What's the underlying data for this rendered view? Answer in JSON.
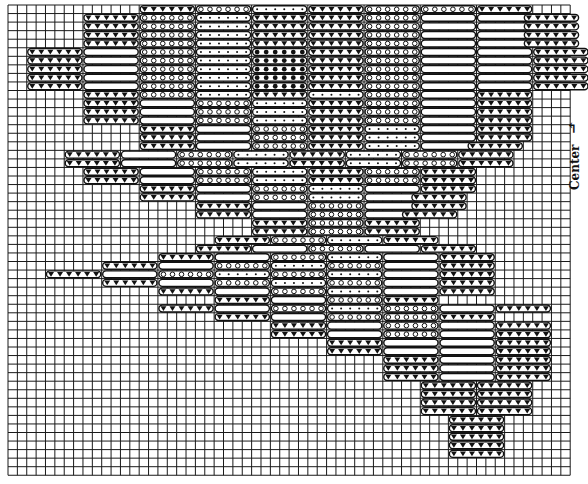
{
  "label": {
    "center": "Center",
    "arrow": "↰"
  },
  "colors": {
    "grid": "#1a1a1a",
    "ink": "#111111",
    "paper": "#ffffff"
  },
  "grid": {
    "x0": 8,
    "y0": 5,
    "cols": 60,
    "rows": 55,
    "cw": 9.37,
    "ch": 8.55
  },
  "pill_len": 6,
  "legend": {
    "tri": "triangle stitch (dark)",
    "empty": "blank stitch",
    "circ": "circle stitch",
    "dot": "dot stitch",
    "solid": "solid dot stitch"
  },
  "rows": [
    {
      "r": 0,
      "pills": [
        [
          14,
          "tri"
        ],
        [
          20,
          "circ"
        ],
        [
          26,
          "dot"
        ],
        [
          32,
          "tri"
        ],
        [
          38,
          "circ"
        ],
        [
          44,
          "circ"
        ],
        [
          50,
          "tri"
        ]
      ]
    },
    {
      "r": 1,
      "pills": [
        [
          8,
          "tri"
        ],
        [
          14,
          "circ"
        ],
        [
          20,
          "dot"
        ],
        [
          26,
          "tri"
        ],
        [
          32,
          "tri"
        ],
        [
          38,
          "circ"
        ],
        [
          44,
          "empty"
        ],
        [
          50,
          "empty"
        ],
        [
          55,
          "tri"
        ]
      ]
    },
    {
      "r": 2,
      "pills": [
        [
          8,
          "tri"
        ],
        [
          14,
          "circ"
        ],
        [
          20,
          "dot"
        ],
        [
          26,
          "tri"
        ],
        [
          32,
          "tri"
        ],
        [
          38,
          "circ"
        ],
        [
          44,
          "empty"
        ],
        [
          50,
          "empty"
        ],
        [
          55,
          "tri"
        ]
      ]
    },
    {
      "r": 3,
      "pills": [
        [
          8,
          "tri"
        ],
        [
          14,
          "circ"
        ],
        [
          20,
          "dot"
        ],
        [
          26,
          "tri"
        ],
        [
          32,
          "tri"
        ],
        [
          38,
          "circ"
        ],
        [
          44,
          "empty"
        ],
        [
          50,
          "empty"
        ],
        [
          55,
          "tri"
        ]
      ]
    },
    {
      "r": 4,
      "pills": [
        [
          8,
          "tri"
        ],
        [
          14,
          "circ"
        ],
        [
          20,
          "dot"
        ],
        [
          26,
          "tri"
        ],
        [
          32,
          "tri"
        ],
        [
          38,
          "circ"
        ],
        [
          44,
          "empty"
        ],
        [
          50,
          "empty"
        ],
        [
          55,
          "tri"
        ]
      ]
    },
    {
      "r": 5,
      "pills": [
        [
          2,
          "tri"
        ],
        [
          8,
          "empty"
        ],
        [
          14,
          "circ"
        ],
        [
          20,
          "dot"
        ],
        [
          26,
          "solid"
        ],
        [
          32,
          "tri"
        ],
        [
          38,
          "circ"
        ],
        [
          44,
          "empty"
        ],
        [
          50,
          "empty"
        ],
        [
          56,
          "tri"
        ]
      ]
    },
    {
      "r": 6,
      "pills": [
        [
          2,
          "tri"
        ],
        [
          8,
          "empty"
        ],
        [
          14,
          "circ"
        ],
        [
          20,
          "dot"
        ],
        [
          26,
          "solid"
        ],
        [
          32,
          "tri"
        ],
        [
          38,
          "circ"
        ],
        [
          44,
          "empty"
        ],
        [
          50,
          "empty"
        ],
        [
          56,
          "tri"
        ]
      ]
    },
    {
      "r": 7,
      "pills": [
        [
          2,
          "tri"
        ],
        [
          8,
          "empty"
        ],
        [
          14,
          "circ"
        ],
        [
          20,
          "dot"
        ],
        [
          26,
          "solid"
        ],
        [
          32,
          "tri"
        ],
        [
          38,
          "circ"
        ],
        [
          44,
          "empty"
        ],
        [
          50,
          "empty"
        ],
        [
          56,
          "tri"
        ]
      ]
    },
    {
      "r": 8,
      "pills": [
        [
          2,
          "tri"
        ],
        [
          8,
          "empty"
        ],
        [
          14,
          "circ"
        ],
        [
          20,
          "dot"
        ],
        [
          26,
          "solid"
        ],
        [
          32,
          "tri"
        ],
        [
          38,
          "circ"
        ],
        [
          44,
          "empty"
        ],
        [
          50,
          "empty"
        ],
        [
          56,
          "tri"
        ]
      ]
    },
    {
      "r": 9,
      "pills": [
        [
          2,
          "tri"
        ],
        [
          8,
          "empty"
        ],
        [
          14,
          "circ"
        ],
        [
          20,
          "dot"
        ],
        [
          26,
          "solid"
        ],
        [
          32,
          "tri"
        ],
        [
          38,
          "circ"
        ],
        [
          44,
          "empty"
        ],
        [
          50,
          "empty"
        ],
        [
          56,
          "tri"
        ]
      ]
    },
    {
      "r": 10,
      "pills": [
        [
          8,
          "tri"
        ],
        [
          14,
          "circ"
        ],
        [
          20,
          "dot"
        ],
        [
          26,
          "tri"
        ],
        [
          32,
          "dot"
        ],
        [
          38,
          "circ"
        ],
        [
          44,
          "empty"
        ],
        [
          50,
          "tri"
        ]
      ]
    },
    {
      "r": 11,
      "pills": [
        [
          8,
          "tri"
        ],
        [
          14,
          "empty"
        ],
        [
          20,
          "circ"
        ],
        [
          26,
          "dot"
        ],
        [
          32,
          "tri"
        ],
        [
          38,
          "circ"
        ],
        [
          44,
          "empty"
        ],
        [
          50,
          "tri"
        ]
      ]
    },
    {
      "r": 12,
      "pills": [
        [
          8,
          "tri"
        ],
        [
          14,
          "empty"
        ],
        [
          20,
          "circ"
        ],
        [
          26,
          "dot"
        ],
        [
          32,
          "tri"
        ],
        [
          38,
          "circ"
        ],
        [
          44,
          "empty"
        ],
        [
          50,
          "tri"
        ]
      ]
    },
    {
      "r": 13,
      "pills": [
        [
          8,
          "tri"
        ],
        [
          14,
          "empty"
        ],
        [
          20,
          "circ"
        ],
        [
          26,
          "dot"
        ],
        [
          32,
          "tri"
        ],
        [
          38,
          "circ"
        ],
        [
          44,
          "empty"
        ],
        [
          50,
          "tri"
        ]
      ]
    },
    {
      "r": 14,
      "pills": [
        [
          14,
          "tri"
        ],
        [
          20,
          "empty"
        ],
        [
          26,
          "circ"
        ],
        [
          32,
          "tri"
        ],
        [
          38,
          "dot"
        ],
        [
          44,
          "empty"
        ],
        [
          50,
          "tri"
        ]
      ]
    },
    {
      "r": 15,
      "pills": [
        [
          14,
          "tri"
        ],
        [
          20,
          "empty"
        ],
        [
          26,
          "circ"
        ],
        [
          32,
          "tri"
        ],
        [
          38,
          "dot"
        ],
        [
          44,
          "empty"
        ],
        [
          50,
          "tri"
        ]
      ]
    },
    {
      "r": 16,
      "pills": [
        [
          14,
          "tri"
        ],
        [
          20,
          "empty"
        ],
        [
          26,
          "circ"
        ],
        [
          32,
          "tri"
        ],
        [
          38,
          "dot"
        ],
        [
          44,
          "empty"
        ],
        [
          49,
          "tri"
        ]
      ]
    },
    {
      "r": 17,
      "pills": [
        [
          6,
          "tri"
        ],
        [
          12,
          "empty"
        ],
        [
          18,
          "circ"
        ],
        [
          24,
          "dot"
        ],
        [
          30,
          "tri"
        ],
        [
          36,
          "dot"
        ],
        [
          42,
          "circ"
        ],
        [
          48,
          "tri"
        ]
      ]
    },
    {
      "r": 18,
      "pills": [
        [
          6,
          "tri"
        ],
        [
          12,
          "empty"
        ],
        [
          18,
          "circ"
        ],
        [
          24,
          "dot"
        ],
        [
          30,
          "tri"
        ],
        [
          36,
          "dot"
        ],
        [
          42,
          "circ"
        ],
        [
          48,
          "tri"
        ]
      ]
    },
    {
      "r": 19,
      "pills": [
        [
          8,
          "tri"
        ],
        [
          14,
          "empty"
        ],
        [
          20,
          "circ"
        ],
        [
          26,
          "dot"
        ],
        [
          32,
          "tri"
        ],
        [
          38,
          "circ"
        ],
        [
          44,
          "tri"
        ]
      ]
    },
    {
      "r": 20,
      "pills": [
        [
          8,
          "tri"
        ],
        [
          14,
          "empty"
        ],
        [
          20,
          "circ"
        ],
        [
          26,
          "dot"
        ],
        [
          32,
          "tri"
        ],
        [
          38,
          "circ"
        ],
        [
          44,
          "tri"
        ]
      ]
    },
    {
      "r": 21,
      "pills": [
        [
          14,
          "tri"
        ],
        [
          20,
          "empty"
        ],
        [
          26,
          "circ"
        ],
        [
          32,
          "dot"
        ],
        [
          38,
          "empty"
        ],
        [
          44,
          "tri"
        ]
      ]
    },
    {
      "r": 22,
      "pills": [
        [
          14,
          "tri"
        ],
        [
          20,
          "empty"
        ],
        [
          26,
          "circ"
        ],
        [
          32,
          "dot"
        ],
        [
          38,
          "empty"
        ],
        [
          43,
          "tri"
        ]
      ]
    },
    {
      "r": 23,
      "pills": [
        [
          20,
          "tri"
        ],
        [
          26,
          "empty"
        ],
        [
          32,
          "circ"
        ],
        [
          38,
          "empty"
        ],
        [
          43,
          "tri"
        ]
      ]
    },
    {
      "r": 24,
      "pills": [
        [
          20,
          "tri"
        ],
        [
          26,
          "empty"
        ],
        [
          32,
          "circ"
        ],
        [
          38,
          "empty"
        ],
        [
          42,
          "tri"
        ]
      ]
    },
    {
      "r": 25,
      "pills": [
        [
          26,
          "tri"
        ],
        [
          32,
          "circ"
        ],
        [
          38,
          "tri"
        ]
      ]
    },
    {
      "r": 26,
      "pills": [
        [
          26,
          "tri"
        ],
        [
          32,
          "circ"
        ],
        [
          38,
          "tri"
        ]
      ]
    },
    {
      "r": 27,
      "pills": [
        [
          22,
          "tri"
        ],
        [
          28,
          "circ"
        ],
        [
          34,
          "dot"
        ],
        [
          40,
          "tri"
        ]
      ]
    },
    {
      "r": 28,
      "pills": [
        [
          20,
          "tri"
        ],
        [
          26,
          "empty"
        ],
        [
          32,
          "circ"
        ],
        [
          38,
          "empty"
        ],
        [
          44,
          "tri"
        ]
      ]
    },
    {
      "r": 29,
      "pills": [
        [
          16,
          "tri"
        ],
        [
          22,
          "empty"
        ],
        [
          28,
          "circ"
        ],
        [
          34,
          "dot"
        ],
        [
          40,
          "empty"
        ],
        [
          46,
          "tri"
        ]
      ]
    },
    {
      "r": 30,
      "pills": [
        [
          10,
          "tri"
        ],
        [
          16,
          "empty"
        ],
        [
          22,
          "circ"
        ],
        [
          28,
          "dot"
        ],
        [
          34,
          "circ"
        ],
        [
          40,
          "empty"
        ],
        [
          46,
          "tri"
        ]
      ]
    },
    {
      "r": 31,
      "pills": [
        [
          4,
          "tri"
        ],
        [
          10,
          "empty"
        ],
        [
          16,
          "circ"
        ],
        [
          22,
          "dot"
        ],
        [
          28,
          "circ"
        ],
        [
          34,
          "dot"
        ],
        [
          40,
          "empty"
        ],
        [
          46,
          "tri"
        ]
      ]
    },
    {
      "r": 32,
      "pills": [
        [
          10,
          "tri"
        ],
        [
          16,
          "empty"
        ],
        [
          22,
          "circ"
        ],
        [
          28,
          "dot"
        ],
        [
          34,
          "circ"
        ],
        [
          40,
          "empty"
        ],
        [
          46,
          "tri"
        ]
      ]
    },
    {
      "r": 33,
      "pills": [
        [
          16,
          "tri"
        ],
        [
          22,
          "empty"
        ],
        [
          28,
          "circ"
        ],
        [
          34,
          "dot"
        ],
        [
          40,
          "empty"
        ],
        [
          46,
          "tri"
        ]
      ]
    },
    {
      "r": 34,
      "pills": [
        [
          22,
          "tri"
        ],
        [
          28,
          "empty"
        ],
        [
          34,
          "circ"
        ],
        [
          40,
          "tri"
        ]
      ]
    },
    {
      "r": 35,
      "pills": [
        [
          16,
          "tri"
        ],
        [
          22,
          "empty"
        ],
        [
          28,
          "circ"
        ],
        [
          34,
          "dot"
        ],
        [
          40,
          "circ"
        ],
        [
          46,
          "empty"
        ],
        [
          52,
          "tri"
        ]
      ]
    },
    {
      "r": 36,
      "pills": [
        [
          22,
          "tri"
        ],
        [
          28,
          "empty"
        ],
        [
          34,
          "circ"
        ],
        [
          40,
          "circ"
        ],
        [
          46,
          "tri"
        ]
      ]
    },
    {
      "r": 37,
      "pills": [
        [
          28,
          "tri"
        ],
        [
          34,
          "empty"
        ],
        [
          40,
          "circ"
        ],
        [
          46,
          "empty"
        ],
        [
          52,
          "tri"
        ]
      ]
    },
    {
      "r": 38,
      "pills": [
        [
          28,
          "tri"
        ],
        [
          34,
          "empty"
        ],
        [
          40,
          "circ"
        ],
        [
          46,
          "empty"
        ],
        [
          52,
          "tri"
        ]
      ]
    },
    {
      "r": 39,
      "pills": [
        [
          34,
          "tri"
        ],
        [
          40,
          "empty"
        ],
        [
          46,
          "empty"
        ],
        [
          52,
          "tri"
        ]
      ]
    },
    {
      "r": 40,
      "pills": [
        [
          34,
          "tri"
        ],
        [
          40,
          "empty"
        ],
        [
          46,
          "empty"
        ],
        [
          52,
          "tri"
        ]
      ]
    },
    {
      "r": 41,
      "pills": [
        [
          40,
          "tri"
        ],
        [
          46,
          "empty"
        ],
        [
          52,
          "tri"
        ]
      ]
    },
    {
      "r": 42,
      "pills": [
        [
          40,
          "tri"
        ],
        [
          46,
          "empty"
        ],
        [
          52,
          "tri"
        ]
      ]
    },
    {
      "r": 43,
      "pills": [
        [
          40,
          "tri"
        ],
        [
          46,
          "empty"
        ],
        [
          52,
          "tri"
        ]
      ]
    },
    {
      "r": 44,
      "pills": [
        [
          44,
          "tri"
        ],
        [
          50,
          "tri"
        ]
      ]
    },
    {
      "r": 45,
      "pills": [
        [
          44,
          "tri"
        ],
        [
          50,
          "tri"
        ]
      ]
    },
    {
      "r": 46,
      "pills": [
        [
          44,
          "tri"
        ],
        [
          50,
          "tri"
        ]
      ]
    },
    {
      "r": 47,
      "pills": [
        [
          44,
          "tri"
        ],
        [
          50,
          "tri"
        ]
      ]
    },
    {
      "r": 48,
      "pills": [
        [
          47,
          "tri"
        ]
      ]
    },
    {
      "r": 49,
      "pills": [
        [
          47,
          "tri"
        ]
      ]
    },
    {
      "r": 50,
      "pills": [
        [
          47,
          "tri"
        ]
      ]
    },
    {
      "r": 51,
      "pills": [
        [
          47,
          "tri"
        ]
      ]
    },
    {
      "r": 52,
      "pills": [
        [
          47,
          "tri"
        ]
      ]
    }
  ]
}
